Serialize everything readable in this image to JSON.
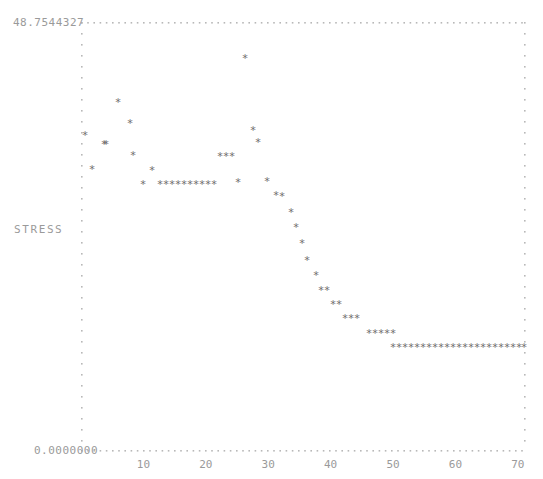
{
  "plot": {
    "y_axis": {
      "label": "STRESS",
      "max_label": "48.7544327",
      "min_label": "0.0000000",
      "max_value": 48.7544327,
      "min_value": 0.0
    },
    "x_axis": {
      "label": "",
      "ticks": [
        10,
        20,
        30,
        40,
        50,
        60,
        70
      ],
      "tick_labels": [
        "10",
        "20",
        "30",
        "40",
        "50",
        "60",
        "70"
      ],
      "min_value": 0,
      "max_value": 71
    },
    "frame": {
      "left_px": 81,
      "right_px": 524,
      "top_px": 22,
      "bottom_px": 450,
      "border_style": "dotted",
      "border_color": "#b8b8b8"
    },
    "marker": {
      "glyph": "*",
      "color": "#6e6e6e",
      "size_px": 7
    }
  },
  "chart_data": {
    "type": "scatter",
    "title": "",
    "xlabel": "",
    "ylabel": "STRESS",
    "xlim": [
      0,
      71
    ],
    "ylim": [
      0,
      48.7544327
    ],
    "grid": false,
    "legend": null,
    "series": [
      {
        "name": "STRESS",
        "x": [
          1,
          2,
          3,
          4,
          5,
          6,
          7,
          8,
          9,
          10,
          11,
          12,
          13,
          14,
          15,
          16,
          17,
          18,
          19,
          20,
          21,
          22,
          23,
          24,
          25,
          26,
          27,
          28,
          29,
          30,
          31,
          32,
          33,
          34,
          35,
          36,
          37,
          38,
          39,
          40,
          41,
          42,
          43,
          44,
          45,
          46,
          47,
          48,
          49,
          50,
          51,
          52,
          53,
          54,
          55,
          56,
          57,
          58,
          59,
          60,
          61,
          62,
          63,
          64,
          65,
          66,
          67,
          68,
          69,
          70
        ],
        "y": [
          33.3,
          30.6,
          30.6,
          35.5,
          32.8,
          34.3,
          30.0,
          28.9,
          28.9,
          28.9,
          28.9,
          28.9,
          28.9,
          28.9,
          28.9,
          28.9,
          28.9,
          28.9,
          31.7,
          31.7,
          31.7,
          28.9,
          29.2,
          43.9,
          33.7,
          32.2,
          30.3,
          28.8,
          27.6,
          26.1,
          24.5,
          22.1,
          19.6,
          17.2,
          15.1,
          14.0,
          14.0,
          12.5,
          12.5,
          11.5,
          11.5,
          11.5,
          10.3,
          10.3,
          10.3,
          10.3,
          10.3,
          9.2,
          9.2,
          9.2,
          9.2,
          9.2,
          9.2,
          9.2,
          9.2,
          9.2,
          9.2,
          9.2,
          9.2,
          9.2,
          9.2,
          9.2,
          9.2,
          9.2,
          9.2,
          9.2,
          9.2,
          9.2,
          9.2,
          9.2
        ]
      }
    ],
    "points_px": [
      [
        85,
        136
      ],
      [
        92,
        170
      ],
      [
        104,
        145
      ],
      [
        106,
        145
      ],
      [
        118,
        103
      ],
      [
        130,
        124
      ],
      [
        133,
        156
      ],
      [
        143,
        185
      ],
      [
        152,
        171
      ],
      [
        160,
        185
      ],
      [
        166,
        185
      ],
      [
        172,
        185
      ],
      [
        178,
        185
      ],
      [
        184,
        185
      ],
      [
        190,
        185
      ],
      [
        196,
        185
      ],
      [
        202,
        185
      ],
      [
        208,
        185
      ],
      [
        214,
        185
      ],
      [
        220,
        157
      ],
      [
        226,
        157
      ],
      [
        232,
        157
      ],
      [
        238,
        183
      ],
      [
        245,
        59
      ],
      [
        253,
        131
      ],
      [
        258,
        143
      ],
      [
        267,
        182
      ],
      [
        276,
        196
      ],
      [
        282,
        197
      ],
      [
        291,
        213
      ],
      [
        296,
        228
      ],
      [
        302,
        244
      ],
      [
        307,
        261
      ],
      [
        316,
        276
      ],
      [
        321,
        291
      ],
      [
        327,
        291
      ],
      [
        333,
        305
      ],
      [
        339,
        305
      ],
      [
        345,
        319
      ],
      [
        351,
        319
      ],
      [
        357,
        319
      ],
      [
        369,
        334
      ],
      [
        375,
        334
      ],
      [
        381,
        334
      ],
      [
        387,
        334
      ],
      [
        393,
        334
      ],
      [
        393,
        348
      ],
      [
        399,
        348
      ],
      [
        405,
        348
      ],
      [
        411,
        348
      ],
      [
        417,
        348
      ],
      [
        423,
        348
      ],
      [
        429,
        348
      ],
      [
        435,
        348
      ],
      [
        441,
        348
      ],
      [
        447,
        348
      ],
      [
        453,
        348
      ],
      [
        459,
        348
      ],
      [
        465,
        348
      ],
      [
        471,
        348
      ],
      [
        477,
        348
      ],
      [
        483,
        348
      ],
      [
        489,
        348
      ],
      [
        495,
        348
      ],
      [
        501,
        348
      ],
      [
        507,
        348
      ],
      [
        513,
        348
      ],
      [
        519,
        348
      ],
      [
        524,
        348
      ]
    ]
  }
}
